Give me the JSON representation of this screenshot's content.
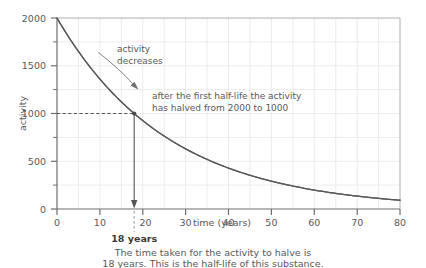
{
  "chart_data": {
    "type": "line",
    "title": "",
    "xlabel": "time (years)",
    "ylabel": "activity",
    "xlim": [
      0,
      80
    ],
    "ylim": [
      0,
      2000
    ],
    "grid": true,
    "legend": "none",
    "x_ticks": [
      0,
      10,
      20,
      30,
      40,
      50,
      60,
      70,
      80
    ],
    "x_tick_labels": [
      "0",
      "10",
      "20",
      "30",
      "40",
      "50",
      "60",
      "70",
      "80"
    ],
    "x_minor_step": 5,
    "y_ticks": [
      0,
      500,
      1000,
      1500,
      2000
    ],
    "y_tick_labels": [
      "0",
      "500",
      "1000",
      "1500",
      "2000"
    ],
    "y_minor_step": 250,
    "series": [
      {
        "name": "activity decay",
        "formula": "A = 2000 * 0.5^(t/18)",
        "x": [
          0,
          2,
          4,
          6,
          8,
          10,
          12,
          14,
          16,
          18,
          20,
          24,
          28,
          32,
          36,
          40,
          44,
          48,
          52,
          56,
          60,
          64,
          68,
          72,
          76,
          80
        ],
        "values": [
          2000,
          1855,
          1720,
          1595,
          1479,
          1372,
          1272,
          1180,
          1094,
          1000,
          928,
          794,
          680,
          583,
          500,
          428,
          367,
          314,
          269,
          231,
          198,
          169,
          145,
          124,
          107,
          91
        ]
      }
    ],
    "points_of_interest": [
      {
        "x": 18,
        "y": 1000,
        "label": "half-life point"
      }
    ],
    "guide_lines": {
      "horizontal_value": 1000,
      "vertical_value": 18
    },
    "annotations": {
      "decrease": {
        "line1": "activity",
        "line2": "decreases"
      },
      "halflife": {
        "line1": "after the first half-life the activity",
        "line2": "has halved from 2000 to 1000"
      },
      "marker": "18 years"
    }
  },
  "caption": {
    "line1": "The time taken for the activity to halve is",
    "line2": "18 years. This is the half-life of this substance."
  },
  "colors": {
    "curve": "#595959",
    "axis": "#7a7a7a",
    "grid": "#dedede",
    "text": "#58595b",
    "marker": "#3a3a3a"
  }
}
